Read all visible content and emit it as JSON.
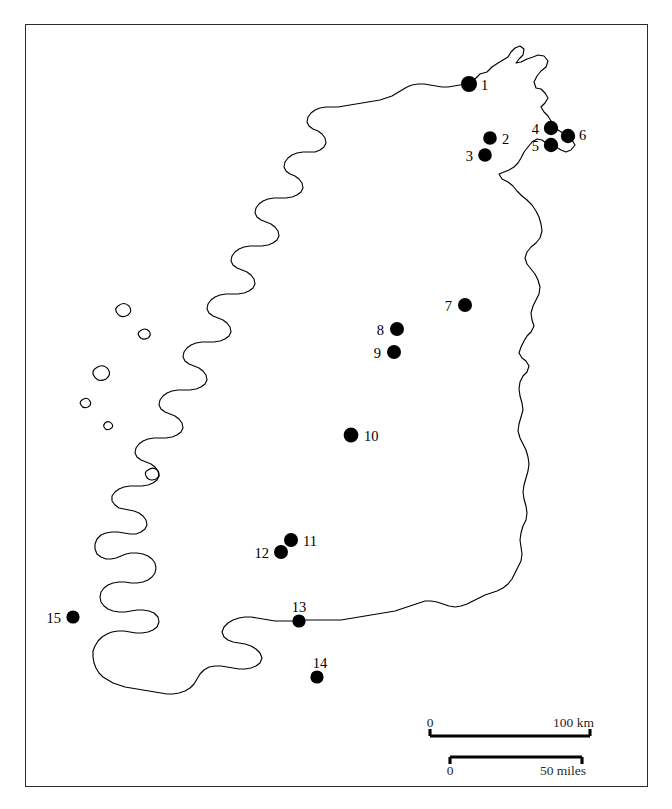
{
  "figure": {
    "kind": "locator-map",
    "region": "Ireland",
    "frame": {
      "x": 25,
      "y": 24,
      "width": 623,
      "height": 763,
      "border_color": "#2b2b2b"
    },
    "background_color": "#ffffff",
    "outline_color": "#000000",
    "marker_color": "#000000"
  },
  "sites": [
    {
      "id": "1",
      "label": "1",
      "x": 469,
      "y": 84,
      "r": 8.0,
      "label_x": 481,
      "label_y": 90,
      "label_anchor": "start"
    },
    {
      "id": "2",
      "label": "2",
      "x": 490,
      "y": 138,
      "r": 6.8,
      "label_x": 502,
      "label_y": 144,
      "label_anchor": "start"
    },
    {
      "id": "3",
      "label": "3",
      "x": 485,
      "y": 155,
      "r": 6.8,
      "label_x": 473,
      "label_y": 161,
      "label_anchor": "end"
    },
    {
      "id": "4",
      "label": "4",
      "x": 551,
      "y": 128,
      "r": 7.2,
      "label_x": 539,
      "label_y": 134,
      "label_anchor": "end"
    },
    {
      "id": "5",
      "label": "5",
      "x": 551,
      "y": 145,
      "r": 7.2,
      "label_x": 539,
      "label_y": 151,
      "label_anchor": "end"
    },
    {
      "id": "6",
      "label": "6",
      "x": 568,
      "y": 136,
      "r": 7.2,
      "label_x": 579,
      "label_y": 140,
      "label_anchor": "start"
    },
    {
      "id": "7",
      "label": "7",
      "x": 465,
      "y": 305,
      "r": 7.0,
      "label_x": 452,
      "label_y": 311,
      "label_anchor": "end"
    },
    {
      "id": "8",
      "label": "8",
      "x": 397,
      "y": 329,
      "r": 7.0,
      "label_x": 384,
      "label_y": 335,
      "label_anchor": "end"
    },
    {
      "id": "9",
      "label": "9",
      "x": 394,
      "y": 352,
      "r": 7.0,
      "label_x": 381,
      "label_y": 358,
      "label_anchor": "end"
    },
    {
      "id": "10",
      "label": "10",
      "x": 351,
      "y": 435,
      "r": 7.4,
      "label_x": 364,
      "label_y": 441,
      "label_anchor": "start"
    },
    {
      "id": "11",
      "label": "11",
      "x": 291,
      "y": 540,
      "r": 7.0,
      "label_x": 303,
      "label_y": 546,
      "label_anchor": "start"
    },
    {
      "id": "12",
      "label": "12",
      "x": 281,
      "y": 552,
      "r": 7.0,
      "label_x": 269,
      "label_y": 558,
      "label_anchor": "end"
    },
    {
      "id": "13",
      "label": "13",
      "x": 299,
      "y": 621,
      "r": 6.6,
      "label_x": 299,
      "label_y": 612,
      "label_anchor": "middle"
    },
    {
      "id": "14",
      "label": "14",
      "x": 317,
      "y": 677,
      "r": 6.6,
      "label_x": 320,
      "label_y": 668,
      "label_anchor": "middle"
    },
    {
      "id": "15",
      "label": "15",
      "x": 73,
      "y": 617,
      "r": 6.6,
      "label_x": 61,
      "label_y": 623,
      "label_anchor": "end"
    }
  ],
  "scale_bars": [
    {
      "name": "kilometres",
      "start_label": "0",
      "end_label": "100 km",
      "labels_position": "above",
      "tick_direction": "up",
      "x1": 430,
      "x2": 590,
      "y": 736,
      "label_y": 727
    },
    {
      "name": "miles",
      "start_label": "0",
      "end_label": "50 miles",
      "labels_position": "below",
      "tick_direction": "down",
      "x1": 450,
      "x2": 582,
      "y": 757,
      "label_y": 775
    }
  ],
  "coastline": {
    "mainland_path": "M469,84 L475,79 L480,74 L487,72 L492,67 L498,63 L503,60 L508,57 L511,52 L515,48 L520,46 L524,49 L523,55 L519,59 L516,63 L521,62 L527,59 L533,57 L538,55 L544,56 L548,61 L546,67 L541,71 L537,76 L534,82 L536,88 L541,89 L545,93 L548,98 L545,103 L541,107 L544,112 L548,116 L551,121 L554,126 L558,130 L563,133 L568,136 L572,140 L575,145 L571,150 L566,152 L561,150 L556,147 L551,145 L546,143 L542,140 L537,139 L532,142 L528,147 L524,152 L521,158 L518,163 L514,167 L509,170 L504,172 L499,174 L502,179 L508,182 L513,186 L517,191 L522,196 L527,200 L532,205 L536,211 L539,217 L541,224 L542,231 L540,238 L536,243 L531,247 L527,252 L525,258 L527,264 L531,269 L535,274 L538,280 L540,287 L539,294 L536,300 L533,306 L531,313 L532,320 L534,326 L531,332 L527,336 L524,341 L521,347 L519,353 L522,358 L526,361 L529,366 L527,372 L523,376 L520,382 L519,389 L520,396 L522,403 L523,410 L521,417 L519,424 L518,431 L520,438 L523,444 L526,450 L528,457 L529,464 L528,471 L526,478 L524,485 L523,492 L524,499 L526,506 L527,513 L526,520 L523,526 L521,533 L520,540 L521,547 L522,554 L521,561 L518,567 L515,573 L512,579 L508,584 L503,588 L497,591 L491,593 L485,595 L479,598 L473,601 L467,604 L461,606 L455,607 L449,606 L443,604 L437,602 L431,601 L425,601 L419,603 L413,605 L407,607 L401,609 L395,611 L389,612 L383,613 L377,614 L371,615 L365,616 L359,617 L353,618 L347,619 L341,620 L335,620 L329,620 L323,620 L317,620 L311,620 L305,620 L299,621 L293,621 L287,621 L281,621 L275,621 L269,620 L263,619 L257,618 L251,617 L245,617 L239,618 L233,620 L228,623 L224,627 L222,632 L224,637 L228,640 L233,642 L239,643 L245,644 L251,646 L256,649 L260,653 L262,658 L260,663 L256,666 L251,668 L245,669 L239,669 L233,668 L227,667 L221,666 L215,666 L209,667 L204,670 L200,674 L197,679 L194,684 L190,688 L185,691 L179,693 L173,694 L167,694 L161,693 L155,692 L149,691 L143,690 L137,689 L131,688 L125,687 L119,685 L113,683 L108,680 L103,677 L99,673 L96,668 L94,663 L93,657 L93,651 L95,646 L98,641 L102,637 L107,634 L112,632 L118,631 L124,631 L130,632 L136,633 L142,633 L148,632 L153,630 L157,627 L159,622 L158,617 L154,613 L149,611 L143,610 L137,610 L131,611 L125,612 L119,612 L113,611 L108,609 L104,606 L101,602 L100,597 L101,592 L104,588 L108,585 L113,583 L119,582 L125,582 L131,583 L137,583 L143,582 L148,580 L152,577 L155,573 L156,568 L155,563 L152,559 L148,556 L143,554 L137,553 L131,553 L126,554 L121,556 L116,558 L111,559 L106,559 L101,557 L97,554 L95,549 L95,544 L97,539 L101,535 L106,533 L112,532 L118,532 L124,533 L130,534 L136,534 L141,532 L145,529 L147,525 L146,520 L143,516 L139,513 L134,511 L129,510 L124,509 L119,508 L115,505 L112,501 L112,496 L115,492 L119,489 L124,487 L130,486 L136,486 L142,486 L148,485 L153,483 L157,480 L159,476 L158,471 L155,467 L151,464 L146,462 L141,460 L137,457 L135,453 L136,448 L139,444 L143,441 L148,439 L154,438 L160,438 L166,438 L172,437 L177,435 L181,432 L183,428 L182,423 L179,419 L175,416 L170,414 L165,412 L161,409 L159,405 L160,400 L163,396 L167,393 L172,391 L178,390 L184,390 L190,390 L196,389 L201,387 L205,384 L207,380 L206,375 L203,371 L199,368 L194,366 L189,364 L185,361 L183,357 L184,352 L187,348 L191,345 L196,343 L202,342 L208,342 L214,342 L220,341 L225,339 L229,336 L231,332 L230,327 L227,323 L223,320 L218,318 L213,316 L209,313 L207,309 L208,304 L211,300 L215,297 L220,295 L226,294 L232,294 L238,294 L244,293 L249,291 L253,288 L255,284 L254,279 L251,275 L247,272 L242,270 L237,268 L233,265 L231,261 L232,256 L235,252 L239,249 L244,247 L250,246 L256,246 L262,246 L268,245 L273,243 L277,240 L279,236 L278,231 L275,227 L271,224 L266,222 L261,220 L257,217 L255,213 L256,208 L259,204 L263,201 L268,199 L274,198 L280,198 L286,198 L292,197 L297,195 L301,192 L303,188 L302,183 L299,179 L295,176 L290,174 L286,171 L284,167 L285,162 L288,158 L292,155 L297,153 L303,152 L309,152 L315,152 L320,150 L324,147 L326,143 L325,138 L322,134 L318,131 L313,129 L309,126 L307,122 L308,117 L311,113 L315,110 L320,108 L326,107 L332,107 L338,107 L344,106 L350,105 L356,104 L362,103 L368,102 L374,101 L380,100 L386,98 L392,96 L397,93 L402,90 L407,87 L412,85 L418,84 L424,84 L430,85 L436,86 L442,87 L448,87 L454,86 L460,85 L466,84 Z",
    "islands": [
      "M118,306 q6,-5 11,0 q4,5 -1,9 q-7,4 -11,-2 q-3,-4 1,-7 Z",
      "M140,331 q5,-4 9,0 q3,4 -1,7 q-6,3 -9,-2 q-2,-3 1,-5 Z",
      "M96,368 q7,-5 12,1 q4,6 -2,10 q-8,4 -12,-3 q-3,-5 2,-8 Z",
      "M82,400 q5,-4 8,1 q2,4 -2,6 q-5,2 -7,-2 q-2,-3 1,-5 Z",
      "M105,423 q4,-3 7,1 q2,3 -2,5 q-4,2 -6,-2 q-1,-2 1,-4 Z",
      "M148,470 q6,-4 10,1 q3,5 -2,8 q-7,3 -10,-3 q-2,-4 2,-6 Z"
    ],
    "note": "Stylized outline of the island of Ireland, simplified from the source figure."
  }
}
